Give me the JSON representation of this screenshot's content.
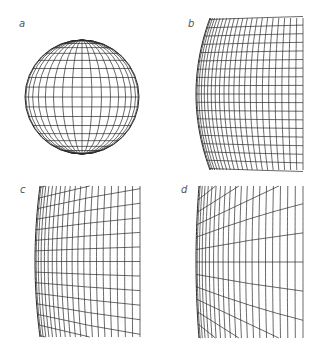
{
  "figure": {
    "panels": [
      {
        "id": "a",
        "label": "a",
        "description": "Orthographic globe with latitude/longitude graticule"
      },
      {
        "id": "b",
        "label": "b",
        "description": "Magnified left limb of sphere, graticule curving"
      },
      {
        "id": "c",
        "label": "c",
        "description": "Further magnified limb, latitude lines diverging"
      },
      {
        "id": "d",
        "label": "d",
        "description": "Extreme magnification, latitude lines radiating from limb"
      }
    ],
    "line_color": "#2a2a2a",
    "background": "#ffffff"
  }
}
